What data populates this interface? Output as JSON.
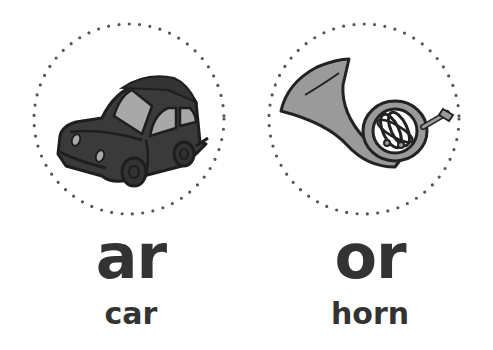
{
  "cards": [
    {
      "sound": "ar",
      "word": "car",
      "picture": "car-illustration",
      "colors": {
        "body": "#3a3a3a",
        "window": "#a8a8a8",
        "outline": "#1e1e1e"
      }
    },
    {
      "sound": "or",
      "word": "horn",
      "picture": "french-horn-illustration",
      "colors": {
        "body": "#9a9a9a",
        "outline": "#222222"
      }
    }
  ],
  "colors": {
    "text": "#333333",
    "dots": "#555555",
    "background": "#ffffff"
  }
}
